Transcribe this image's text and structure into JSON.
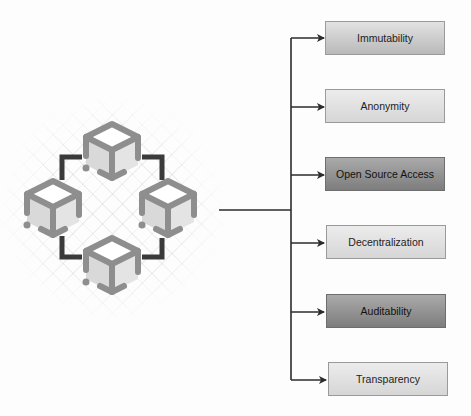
{
  "diagram": {
    "central_node": {
      "icon": "blockchain-network-icon",
      "description": "Four connected cubes (blocks) arranged in a ring"
    },
    "features": [
      {
        "label": "Immutability",
        "shade": "medium",
        "color": "#c9c9c9"
      },
      {
        "label": "Anonymity",
        "shade": "light",
        "color": "#dedede"
      },
      {
        "label": "Open Source Access",
        "shade": "dark",
        "color": "#8f8f8f"
      },
      {
        "label": "Decentralization",
        "shade": "light",
        "color": "#dadada"
      },
      {
        "label": "Auditability",
        "shade": "dark",
        "color": "#8f8f8f"
      },
      {
        "label": "Transparency",
        "shade": "light",
        "color": "#d8d8d8"
      }
    ],
    "colors": {
      "line": "#2b2b2b",
      "cube_outline": "#8e8e8e",
      "cube_face": "#dcdcdc",
      "link": "#3a3a3a"
    }
  }
}
